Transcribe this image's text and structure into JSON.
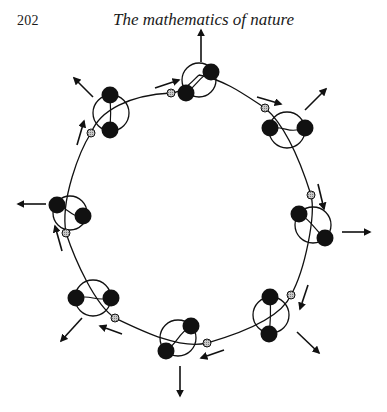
{
  "page": {
    "page_number": "202",
    "running_head": "The mathematics of nature"
  },
  "figure": {
    "colors": {
      "ink": "#111111",
      "node_fill": "#a8a8a8",
      "background": "#ffffff"
    },
    "chain_path": "M199,75 C225,80 245,95 265,108 C285,125 300,160 311,195 C316,215 305,270 291,295 C280,320 235,335 207,343 C180,350 140,330 115,318 C95,305 75,260 66,233 C60,200 80,150 91,133 C100,110 130,95 171,93 C185,92 195,78 199,75",
    "units": [
      {
        "id": "top",
        "cx": 199,
        "cy": 80,
        "r": 17,
        "balls": [
          [
            211,
            72
          ],
          [
            186,
            93
          ]
        ],
        "node": [
          171,
          93
        ],
        "radial": [
          [
            201,
            62
          ],
          [
            201,
            30
          ]
        ],
        "tangent": [
          [
            155,
            88
          ],
          [
            179,
            80
          ]
        ]
      },
      {
        "id": "upper-right",
        "cx": 287,
        "cy": 130,
        "r": 18,
        "balls": [
          [
            270,
            128
          ],
          [
            305,
            128
          ]
        ],
        "node": [
          265,
          108
        ],
        "radial": [
          [
            305,
            110
          ],
          [
            326,
            89
          ]
        ],
        "tangent": [
          [
            257,
            97
          ],
          [
            281,
            104
          ]
        ]
      },
      {
        "id": "right",
        "cx": 313,
        "cy": 225,
        "r": 18,
        "balls": [
          [
            299,
            214
          ],
          [
            325,
            238
          ]
        ],
        "node": [
          311,
          195
        ],
        "radial": [
          [
            342,
            232
          ],
          [
            370,
            232
          ]
        ],
        "tangent": [
          [
            318,
            184
          ],
          [
            324,
            209
          ]
        ]
      },
      {
        "id": "lower-right",
        "cx": 271,
        "cy": 315,
        "r": 18,
        "balls": [
          [
            270,
            297
          ],
          [
            269,
            334
          ]
        ],
        "node": [
          291,
          295
        ],
        "radial": [
          [
            297,
            332
          ],
          [
            319,
            353
          ]
        ],
        "tangent": [
          [
            308,
            285
          ],
          [
            300,
            309
          ]
        ]
      },
      {
        "id": "bottom",
        "cx": 178,
        "cy": 338,
        "r": 18,
        "balls": [
          [
            191,
            326
          ],
          [
            166,
            351
          ]
        ],
        "node": [
          207,
          343
        ],
        "radial": [
          [
            180,
            366
          ],
          [
            180,
            396
          ]
        ],
        "tangent": [
          [
            224,
            350
          ],
          [
            201,
            358
          ]
        ]
      },
      {
        "id": "lower-left",
        "cx": 93,
        "cy": 298,
        "r": 18,
        "balls": [
          [
            76,
            298
          ],
          [
            111,
            298
          ]
        ],
        "node": [
          115,
          318
        ],
        "radial": [
          [
            82,
            318
          ],
          [
            61,
            341
          ]
        ],
        "tangent": [
          [
            122,
            334
          ],
          [
            100,
            326
          ]
        ]
      },
      {
        "id": "left",
        "cx": 70,
        "cy": 213,
        "r": 17,
        "balls": [
          [
            57,
            205
          ],
          [
            83,
            216
          ]
        ],
        "node": [
          66,
          233
        ],
        "radial": [
          [
            46,
            204
          ],
          [
            18,
            204
          ]
        ],
        "tangent": [
          [
            62,
            251
          ],
          [
            55,
            226
          ]
        ]
      },
      {
        "id": "upper-left",
        "cx": 111,
        "cy": 113,
        "r": 18,
        "balls": [
          [
            110,
            95
          ],
          [
            110,
            130
          ]
        ],
        "node": [
          91,
          133
        ],
        "radial": [
          [
            93,
            97
          ],
          [
            74,
            78
          ]
        ],
        "tangent": [
          [
            77,
            145
          ],
          [
            84,
            121
          ]
        ]
      }
    ]
  }
}
